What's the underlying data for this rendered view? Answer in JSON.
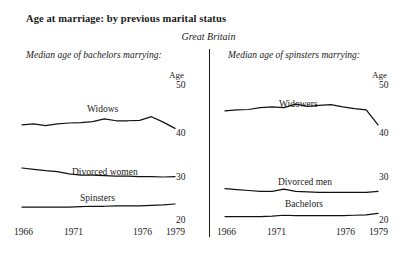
{
  "header": {
    "title": "Age at marriage: by previous marital status",
    "subtitle": "Great Britain"
  },
  "panels": {
    "left_heading": "Median age of bachelors marrying:",
    "right_heading": "Median age of spinsters marrying:"
  },
  "axis": {
    "unit_label": "Age",
    "y_ticks": [
      "50",
      "40",
      "30",
      "20"
    ],
    "x_ticks": [
      "1966",
      "1971",
      "1976",
      "1979"
    ]
  },
  "series_labels": {
    "widows": "Widows",
    "divorced_women": "Divorced women",
    "spinsters": "Spinsters",
    "widowers": "Widowers",
    "divorced_men": "Divorced men",
    "bachelors": "Bachelors"
  },
  "chart_data": {
    "type": "line",
    "title": "Age at marriage: by previous marital status",
    "subtitle": "Great Britain",
    "xlabel": "",
    "ylabel": "Age",
    "ylim": [
      20,
      50
    ],
    "grid": false,
    "legend": "inline-labels",
    "x": [
      1966,
      1967,
      1968,
      1969,
      1970,
      1971,
      1972,
      1973,
      1974,
      1975,
      1976,
      1977,
      1978,
      1979
    ],
    "xlim": [
      1966,
      1979
    ],
    "panels": [
      {
        "name": "Median age of bachelors marrying:",
        "series": [
          {
            "name": "Widows",
            "values": [
              41.6,
              41.8,
              41.4,
              41.8,
              42.0,
              42.1,
              42.3,
              42.9,
              42.5,
              42.5,
              42.6,
              43.4,
              42.2,
              40.8
            ]
          },
          {
            "name": "Divorced women",
            "values": [
              32.0,
              31.7,
              31.4,
              31.2,
              30.7,
              30.4,
              30.4,
              30.3,
              30.2,
              30.2,
              30.1,
              30.1,
              30.0,
              30.1
            ]
          },
          {
            "name": "Spinsters",
            "values": [
              23.3,
              23.3,
              23.3,
              23.3,
              23.3,
              23.4,
              23.5,
              23.5,
              23.6,
              23.6,
              23.6,
              23.7,
              23.8,
              24.0
            ]
          }
        ]
      },
      {
        "name": "Median age of spinsters marrying:",
        "series": [
          {
            "name": "Widowers",
            "values": [
              44.7,
              44.9,
              45.0,
              45.4,
              45.6,
              45.4,
              46.2,
              45.7,
              45.9,
              46.1,
              45.6,
              45.2,
              44.9,
              41.6
            ]
          },
          {
            "name": "Divorced men",
            "values": [
              27.4,
              27.2,
              27.0,
              26.8,
              26.8,
              27.3,
              26.8,
              26.7,
              26.6,
              26.6,
              26.6,
              26.6,
              26.6,
              26.8
            ]
          },
          {
            "name": "Bachelors",
            "values": [
              21.2,
              21.2,
              21.2,
              21.2,
              21.3,
              21.5,
              21.4,
              21.4,
              21.4,
              21.4,
              21.4,
              21.5,
              21.6,
              21.9
            ]
          }
        ]
      }
    ]
  }
}
